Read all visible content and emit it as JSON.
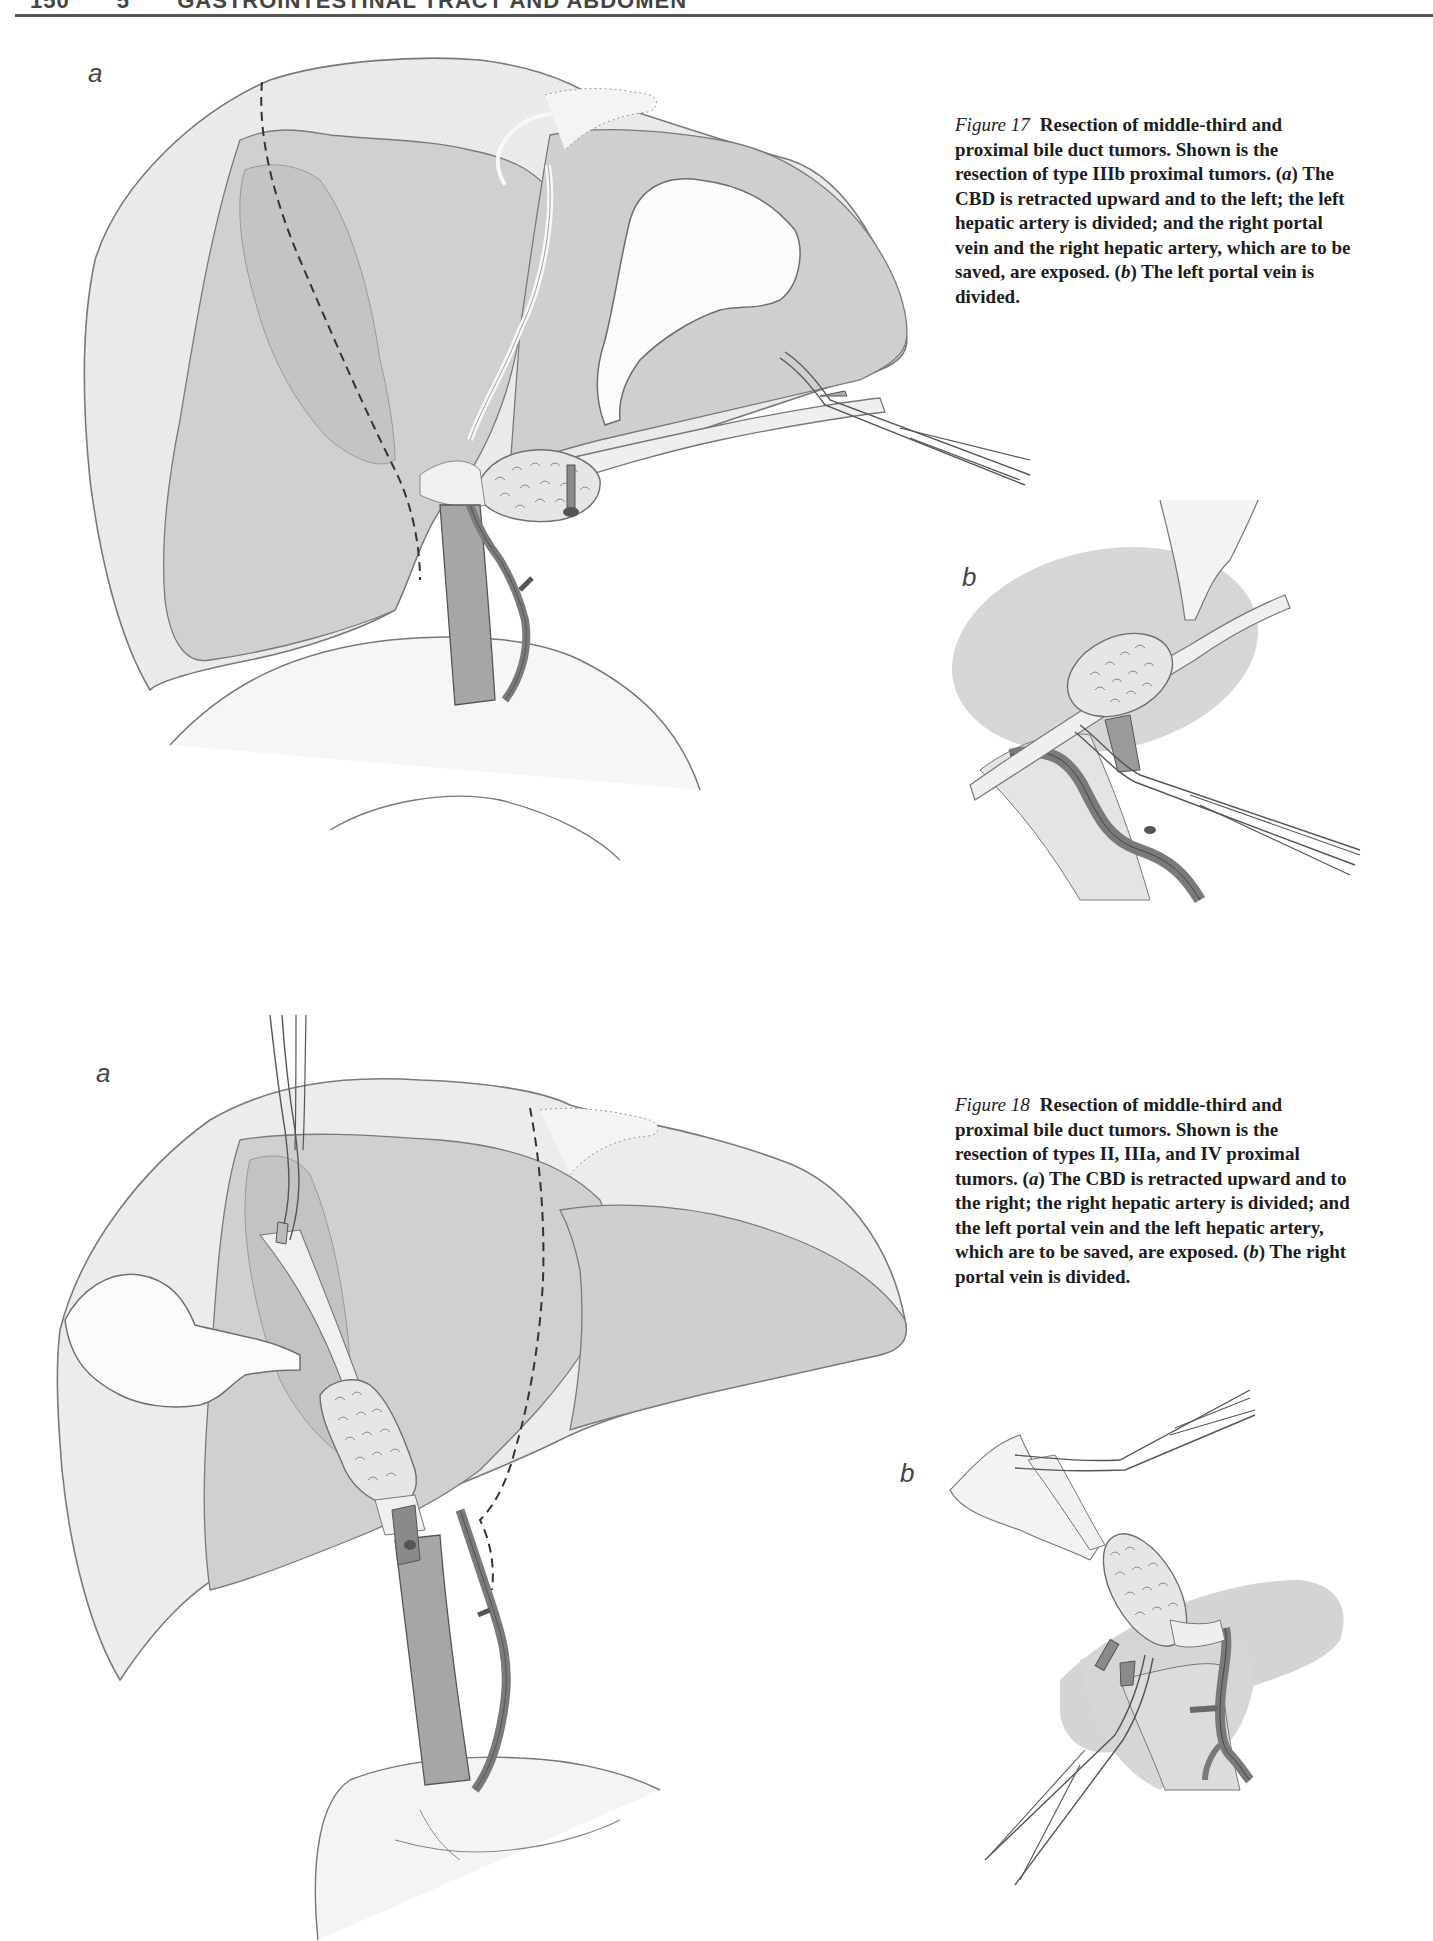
{
  "page": {
    "running_head": {
      "page_number": "150",
      "chapter_number": "5",
      "chapter_title": "GASTROINTESTINAL TRACT AND ABDOMEN"
    }
  },
  "figures": [
    {
      "id": "figure-17",
      "number_label": "Figure 17",
      "caption_parts": [
        {
          "text": "Resection of middle-third and proximal bile duct tumors. Shown is the resection of type IIIb proximal tumors. ",
          "style": "bold"
        },
        {
          "text": "(",
          "style": "bold"
        },
        {
          "text": "a",
          "style": "italic"
        },
        {
          "text": ") The CBD is retracted upward and to the left; the left hepatic artery is divided; and the right portal vein and the right hepatic artery, which are to be saved, are exposed. (",
          "style": "bold"
        },
        {
          "text": "b",
          "style": "italic"
        },
        {
          "text": ") The left portal vein is divided.",
          "style": "bold"
        }
      ],
      "caption_text": {
        "lead": "Resection of middle-third and proximal bile duct tumors. Shown is the resection of type IIIb proximal tumors. (",
        "a_label": "a",
        "a_text": ") The CBD is retracted upward and to the left; the left hepatic artery is divided; and the right portal vein and the right hepatic artery, which are to be saved, are exposed. (",
        "b_label": "b",
        "b_text": ") The left portal vein is divided."
      },
      "panels": [
        {
          "label": "a",
          "description": "Liver with gallbladder, dashed resection line, tumor at hilum, CBD retracted with forceps"
        },
        {
          "label": "b",
          "description": "Close-up: tumor on bile duct, forceps clamping left portal vein"
        }
      ]
    },
    {
      "id": "figure-18",
      "number_label": "Figure 18",
      "caption_text": {
        "lead": "Resection of middle-third and proximal bile duct tumors. Shown is the resection of types II, IIIa, and IV proximal tumors. (",
        "a_label": "a",
        "a_text": ") The CBD is retracted upward and to the right; the right hepatic artery is divided; and the left portal vein and the left hepatic artery, which are to be saved, are exposed. (",
        "b_label": "b",
        "b_text": ") The right portal vein is divided."
      },
      "panels": [
        {
          "label": "a",
          "description": "Liver with gallbladder on left, forceps from above, dashed resection line, tumor on CBD, stomach/duodenum below"
        },
        {
          "label": "b",
          "description": "Close-up: tumor on bile duct held by forceps above, second forceps clamping right portal vein"
        }
      ]
    }
  ],
  "colors": {
    "liver_light": "#ececec",
    "liver_mid": "#d4d4d4",
    "liver_dark": "#bcbcbc",
    "vessel": "#8a8a8a",
    "outline": "#6e6e6e",
    "text": "#1c1c1c"
  }
}
